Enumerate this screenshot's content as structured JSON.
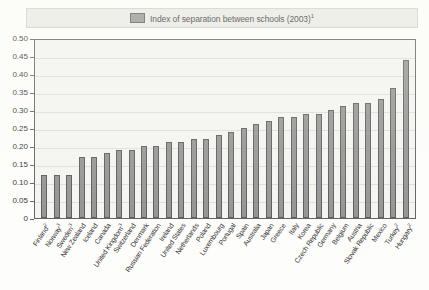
{
  "legend": {
    "swatch_icon": "legend-swatch-icon",
    "label": "Index of separation between schools (2003)",
    "superscript": "1",
    "swatch_color": "#8a8a8a"
  },
  "axes": {
    "y_ticks": [
      "0.50",
      "0.45",
      "0.40",
      "0.35",
      "0.30",
      "0.25",
      "0.20",
      "0.15",
      "0.10",
      "0.05",
      "0"
    ]
  },
  "chart_data": {
    "type": "bar",
    "title": "Index of separation between schools (2003)",
    "xlabel": "",
    "ylabel": "",
    "ylim": [
      0,
      0.5
    ],
    "ytick_step": 0.05,
    "grid": true,
    "legend_position": "top-center",
    "bar_color": "#8c8c8c",
    "categories": [
      "Finland²",
      "Norway³",
      "Sweden³",
      "New Zealand",
      "Iceland",
      "Canada",
      "United Kingdom³",
      "Switzerland",
      "Denmark",
      "Russian Federation",
      "Ireland",
      "United States",
      "Netherlands",
      "Poland",
      "Luxembourg",
      "Portugal",
      "Spain",
      "Australia",
      "Japan",
      "Greece",
      "Italy",
      "Korea",
      "Czech Republic",
      "Germany",
      "Belgium",
      "Austria",
      "Slovak Republic",
      "Mexico",
      "Turkey²",
      "Hungary²"
    ],
    "values": [
      0.12,
      0.12,
      0.12,
      0.17,
      0.17,
      0.18,
      0.19,
      0.19,
      0.2,
      0.2,
      0.21,
      0.21,
      0.22,
      0.22,
      0.23,
      0.24,
      0.25,
      0.26,
      0.27,
      0.28,
      0.28,
      0.29,
      0.29,
      0.3,
      0.31,
      0.32,
      0.32,
      0.33,
      0.36,
      0.44
    ]
  }
}
